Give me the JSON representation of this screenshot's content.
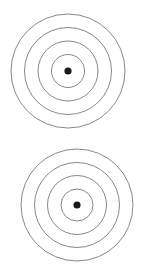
{
  "document": {
    "title": "Concentric Circles Diagram",
    "background_color": "#ffffff",
    "width": 146,
    "height": 271,
    "figure_count": 2,
    "description": "Two bullseye / concentric-circle targets stacked vertically"
  },
  "style": {
    "ring_stroke_color": "#7a7a7a",
    "ring_stroke_width": 0.9,
    "ring_fill": "none",
    "dot_fill_color": "#1a1a1a"
  },
  "figures": [
    {
      "id": "target-top",
      "label": "Top concentric circles",
      "center_x": 68,
      "center_y": 71,
      "ring_count": 4,
      "rings": [
        {
          "index": 1,
          "radius": 57
        },
        {
          "index": 2,
          "radius": 43.5
        },
        {
          "index": 3,
          "radius": 30
        },
        {
          "index": 4,
          "radius": 16.5
        }
      ],
      "center_dot": {
        "radius": 3.6,
        "cx": 68,
        "cy": 71
      }
    },
    {
      "id": "target-bottom",
      "label": "Bottom concentric circles",
      "center_x": 77,
      "center_y": 205,
      "ring_count": 4,
      "rings": [
        {
          "index": 1,
          "radius": 56
        },
        {
          "index": 2,
          "radius": 42.5
        },
        {
          "index": 3,
          "radius": 29.5
        },
        {
          "index": 4,
          "radius": 16
        }
      ],
      "center_dot": {
        "radius": 3.6,
        "cx": 77,
        "cy": 205
      }
    }
  ]
}
